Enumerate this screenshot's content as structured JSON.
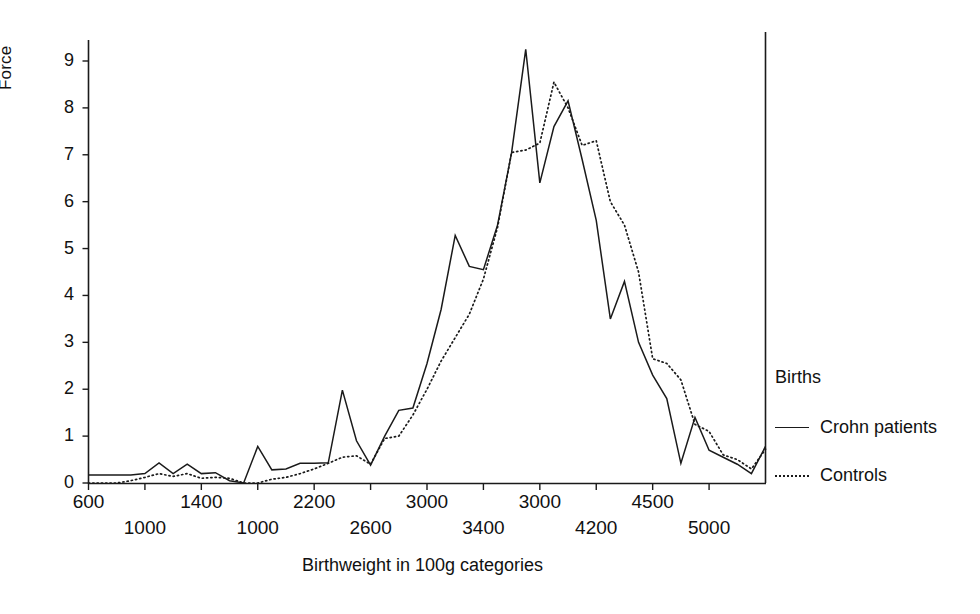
{
  "chart_data": {
    "type": "line",
    "title": "",
    "xlabel": "Birthweight in 100g categories",
    "ylabel": "Force",
    "ylim": [
      0,
      9.6
    ],
    "yticks": [
      0,
      1,
      2,
      3,
      4,
      5,
      6,
      7,
      8,
      9
    ],
    "ytick_labels": [
      "0",
      "1",
      "2",
      "3",
      "4",
      "5",
      "6",
      "7",
      "8",
      "9"
    ],
    "xlim": [
      600,
      5400
    ],
    "xticks": [
      600,
      1000,
      1400,
      1000,
      2200,
      2600,
      3000,
      3400,
      3000,
      4200,
      4500,
      5000
    ],
    "xtick_labels_upper": [
      "600",
      "1400",
      "2200",
      "3000",
      "3000",
      "4500"
    ],
    "xtick_labels_lower": [
      "1000",
      "1000",
      "2600",
      "3400",
      "4200",
      "5000"
    ],
    "grid": false,
    "legend_position": "right",
    "legend_title": "Births",
    "series": [
      {
        "name": "Crohn patients",
        "style": "solid",
        "color": "#1a1a1a",
        "x": [
          600,
          700,
          800,
          900,
          1000,
          1100,
          1200,
          1300,
          1400,
          1500,
          1600,
          1700,
          1800,
          1900,
          2000,
          2100,
          2200,
          2300,
          2400,
          2500,
          2600,
          2700,
          2800,
          2900,
          3000,
          3100,
          3200,
          3300,
          3400,
          3500,
          3600,
          3700,
          3800,
          3900,
          4000,
          4100,
          4200,
          4300,
          4400,
          4500,
          4600,
          4700,
          4800,
          4900,
          5000,
          5100,
          5200,
          5300,
          5400
        ],
        "y": [
          0.17,
          0.17,
          0.17,
          0.17,
          0.2,
          0.43,
          0.2,
          0.4,
          0.2,
          0.22,
          0.05,
          0.0,
          0.78,
          0.28,
          0.3,
          0.42,
          0.42,
          0.43,
          1.98,
          0.9,
          0.38,
          1.0,
          1.55,
          1.6,
          2.55,
          3.7,
          5.28,
          4.62,
          4.55,
          5.5,
          7.05,
          9.25,
          6.4,
          7.6,
          8.15,
          6.9,
          5.6,
          3.5,
          4.3,
          3.0,
          2.3,
          1.8,
          0.42,
          1.4,
          0.7,
          0.55,
          0.4,
          0.2,
          0.78
        ],
        "y_notes": "peak 9.25 at 3700, secondary peak 8.15 at 4000"
      },
      {
        "name": "Controls",
        "style": "dotted",
        "color": "#1a1a1a",
        "x": [
          600,
          700,
          800,
          900,
          1000,
          1100,
          1200,
          1300,
          1400,
          1500,
          1600,
          1700,
          1800,
          1900,
          2000,
          2100,
          2200,
          2300,
          2400,
          2500,
          2600,
          2700,
          2800,
          2900,
          3000,
          3100,
          3200,
          3300,
          3400,
          3500,
          3600,
          3700,
          3800,
          3900,
          4000,
          4100,
          4200,
          4300,
          4400,
          4500,
          4600,
          4700,
          4800,
          4900,
          5000,
          5100,
          5200,
          5300,
          5400
        ],
        "y": [
          0.0,
          0.0,
          0.0,
          0.05,
          0.12,
          0.2,
          0.14,
          0.2,
          0.1,
          0.12,
          0.1,
          0.0,
          0.0,
          0.08,
          0.12,
          0.2,
          0.3,
          0.42,
          0.55,
          0.58,
          0.4,
          0.95,
          1.0,
          1.45,
          2.0,
          2.6,
          3.1,
          3.6,
          4.35,
          5.45,
          7.05,
          7.1,
          7.25,
          8.55,
          8.0,
          7.2,
          7.3,
          6.0,
          5.5,
          4.5,
          2.65,
          2.55,
          2.2,
          1.25,
          1.1,
          0.6,
          0.5,
          0.3,
          0.72
        ],
        "y_notes": "peak 8.55 at 3900"
      }
    ]
  },
  "legend": {
    "title": "Births",
    "entries": [
      {
        "label": "Crohn patients",
        "style": "solid"
      },
      {
        "label": "Controls",
        "style": "dotted"
      }
    ]
  },
  "axes": {
    "y_title": "Force",
    "x_title": "Birthweight in 100g categories"
  }
}
